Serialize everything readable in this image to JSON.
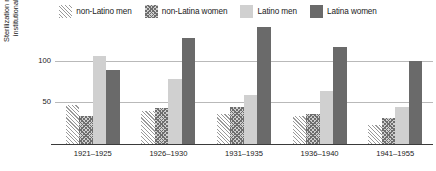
{
  "chart_data": {
    "type": "bar",
    "title": "",
    "subtitle": "",
    "xlabel": "",
    "ylabel": "Sterilization rates per 1,000 institutionalized patients",
    "categories": [
      "1921–1925",
      "1926–1930",
      "1931–1935",
      "1936–1940",
      "1941–1955"
    ],
    "series": [
      {
        "name": "non-Latino men",
        "swatch": "hatch-light",
        "color": "#9a9a9a",
        "values": [
          47,
          40,
          36,
          33,
          23
        ]
      },
      {
        "name": "non-Latina women",
        "swatch": "hatch-dark",
        "color": "#6e6e6e",
        "values": [
          33,
          43,
          44,
          36,
          31
        ]
      },
      {
        "name": "Latino men",
        "swatch": "light-solid",
        "color": "#d0d0d0",
        "values": [
          105,
          78,
          59,
          64,
          44
        ]
      },
      {
        "name": "Latina women",
        "swatch": "dark-solid",
        "color": "#6a6a6a",
        "values": [
          89,
          127,
          140,
          116,
          99
        ]
      }
    ],
    "yticks": [
      50,
      100
    ],
    "ylim": [
      0,
      145
    ],
    "grid": true,
    "legend_position": "top-center"
  }
}
